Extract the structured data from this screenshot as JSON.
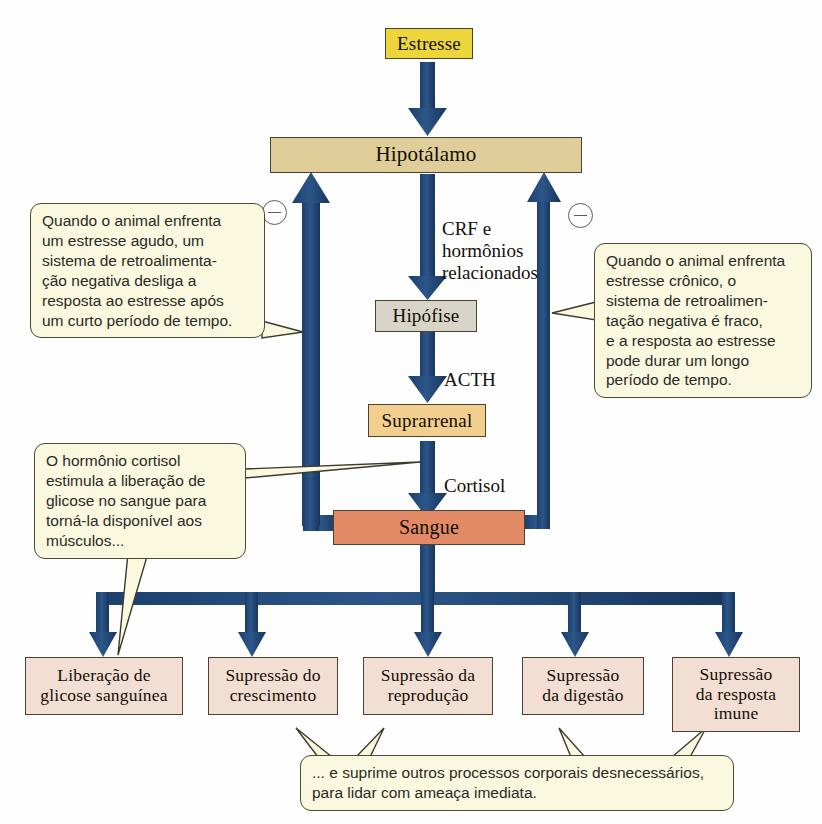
{
  "diagram": {
    "colors": {
      "arrow_blue": "#1f4878",
      "stress_yellow": "#ecd63c",
      "hypothalamus_tan": "#dfcd9a",
      "pituitary_gray": "#d8d5c8",
      "adrenal_orange": "#f2cf8f",
      "blood_salmon": "#e28a66",
      "outcome_pink": "#f2ded2",
      "callout_cream": "#fbf8e0",
      "box_border": "#4a4330",
      "minus_gray": "#5c5c5c"
    },
    "nodes": [
      {
        "id": "estresse",
        "label": "Estresse",
        "fill": "#ecd63c"
      },
      {
        "id": "hipotalamo",
        "label": "Hipotálamo",
        "fill": "#dfcd9a"
      },
      {
        "id": "hipofise",
        "label": "Hipófise",
        "fill": "#d8d5c8"
      },
      {
        "id": "suprarrenal",
        "label": "Suprarrenal",
        "fill": "#f2cf8f"
      },
      {
        "id": "sangue",
        "label": "Sangue",
        "fill": "#e28a66"
      }
    ],
    "outcomes": [
      {
        "id": "glicose",
        "label": "Liberação de\nglicose sanguínea"
      },
      {
        "id": "crescimento",
        "label": "Supressão do\ncrescimento"
      },
      {
        "id": "reproducao",
        "label": "Supressão da\nreprodução"
      },
      {
        "id": "digestao",
        "label": "Supressão\nda digestão"
      },
      {
        "id": "imune",
        "label": "Supressão\nda resposta\nimune"
      }
    ],
    "edge_labels": [
      {
        "id": "crf",
        "text": "CRF e\nhormônios\nrelacionados"
      },
      {
        "id": "acth",
        "text": "ACTH"
      },
      {
        "id": "cortisol",
        "text": "Cortisol"
      }
    ],
    "callouts": [
      {
        "id": "agudo",
        "text": "Quando o animal enfrenta um estresse agudo, um sistema de retroalimenta-ção negativa desliga a resposta ao estresse após um curto período de tempo.",
        "lines": [
          "Quando o animal enfrenta",
          "um estresse agudo, um",
          "sistema de retroalimenta-",
          "ção negativa desliga a",
          "resposta ao estresse após",
          "um curto período de tempo."
        ]
      },
      {
        "id": "cronico",
        "text": "Quando o animal enfrenta estresse crônico, o sistema de retroalimentação negativa é fraco, e a resposta ao estresse pode durar um longo período de tempo.",
        "lines": [
          "Quando o animal enfrenta",
          "estresse crônico, o",
          "sistema de retroalimen-",
          "tação negativa é fraco,",
          "e a resposta ao estresse",
          "pode durar um longo",
          "período de tempo."
        ]
      },
      {
        "id": "cortisol-nota",
        "text": "O hormônio cortisol estimula a liberação de glicose no sangue para torná-la disponível aos músculos...",
        "lines": [
          "O hormônio cortisol",
          "estimula a liberação de",
          "glicose no sangue para",
          "torná-la disponível aos",
          "músculos..."
        ]
      },
      {
        "id": "suprime-nota",
        "text": "... e suprime outros processos corporais desnecessários, para lidar com ameaça imediata.",
        "lines": [
          "... e suprime outros processos corporais desnecessários,",
          "para lidar com ameaça imediata."
        ]
      }
    ],
    "signs": [
      {
        "id": "minus-left",
        "symbol": "−",
        "meaning": "negative-feedback"
      },
      {
        "id": "minus-right",
        "symbol": "−",
        "meaning": "negative-feedback"
      }
    ]
  }
}
